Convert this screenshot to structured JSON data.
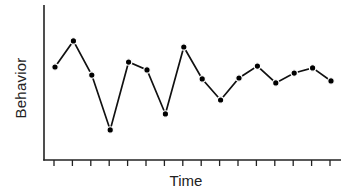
{
  "chart_data": {
    "type": "line",
    "title": "",
    "xlabel": "Time",
    "ylabel": "Behavior",
    "x": [
      1,
      2,
      3,
      4,
      5,
      6,
      7,
      8,
      9,
      10,
      11,
      12,
      13,
      14,
      15,
      16
    ],
    "values": [
      60.0,
      76.8,
      54.8,
      19.4,
      63.2,
      58.1,
      29.7,
      72.9,
      52.3,
      38.7,
      52.9,
      60.6,
      49.7,
      56.1,
      59.4,
      51.0
    ],
    "ylim": [
      0,
      100
    ],
    "xtick_count": 16,
    "tick_labels_shown": false,
    "grid": false,
    "legend": null,
    "markers": "filled-circle",
    "line_color": "#111111"
  },
  "labels": {
    "x_axis": "Time",
    "y_axis": "Behavior"
  }
}
